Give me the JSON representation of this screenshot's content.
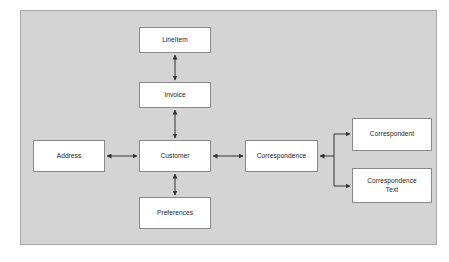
{
  "diagram": {
    "type": "entity-relationship-block-diagram",
    "panel": {
      "background_color": "#d4d4d4",
      "border_color": "#a8a8a8"
    },
    "box_style": {
      "fill_color": "#ffffff",
      "border_color": "#8a8a8a",
      "text_color": "#1d1d1d"
    },
    "connector_style": {
      "line_color": "#333333",
      "arrowheads": "double-ended",
      "routing": "orthogonal"
    },
    "nodes": [
      {
        "id": "lineitem",
        "label": "LineItem"
      },
      {
        "id": "invoice",
        "label": "Invoice"
      },
      {
        "id": "customer",
        "label": "Customer"
      },
      {
        "id": "preferences",
        "label": "Preferences"
      },
      {
        "id": "address",
        "label": "Address"
      },
      {
        "id": "correspondence",
        "label": "Correspondence"
      },
      {
        "id": "correspondent",
        "label": "Correspondent"
      },
      {
        "id": "correspondence_text",
        "label": "Correspondence\nText"
      }
    ],
    "edges": [
      {
        "from": "lineitem",
        "to": "invoice",
        "arrow": "both"
      },
      {
        "from": "invoice",
        "to": "customer",
        "arrow": "both"
      },
      {
        "from": "customer",
        "to": "preferences",
        "arrow": "both"
      },
      {
        "from": "address",
        "to": "customer",
        "arrow": "both"
      },
      {
        "from": "customer",
        "to": "correspondence",
        "arrow": "both"
      },
      {
        "from": "correspondence",
        "to": "correspondent",
        "arrow": "both"
      },
      {
        "from": "correspondence",
        "to": "correspondence_text",
        "arrow": "both"
      }
    ]
  }
}
